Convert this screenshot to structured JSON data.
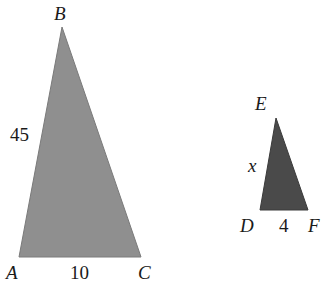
{
  "diagram": {
    "large_triangle": {
      "fill": "#8f8f8f",
      "vertices": {
        "A": "A",
        "B": "B",
        "C": "C"
      },
      "side_AB": "45",
      "side_AC": "10"
    },
    "small_triangle": {
      "fill": "#4a4a4a",
      "vertices": {
        "D": "D",
        "E": "E",
        "F": "F"
      },
      "side_DE": "x",
      "side_DF": "4"
    }
  }
}
